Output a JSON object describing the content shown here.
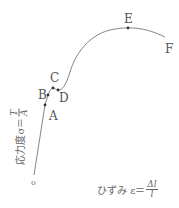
{
  "diagram": {
    "type": "stress-strain-curve",
    "points": [
      {
        "id": "A",
        "label": "A"
      },
      {
        "id": "B",
        "label": "B"
      },
      {
        "id": "C",
        "label": "C"
      },
      {
        "id": "D",
        "label": "D"
      },
      {
        "id": "E",
        "label": "E"
      },
      {
        "id": "F",
        "label": "F"
      }
    ],
    "origin_label": "o",
    "y_axis": {
      "text": "応力度σ＝",
      "frac_num": "T",
      "frac_den": "A"
    },
    "x_axis": {
      "text": "ひずみ ε＝",
      "frac_num": "Δl",
      "frac_den": "l"
    },
    "line_color": "#666666"
  }
}
